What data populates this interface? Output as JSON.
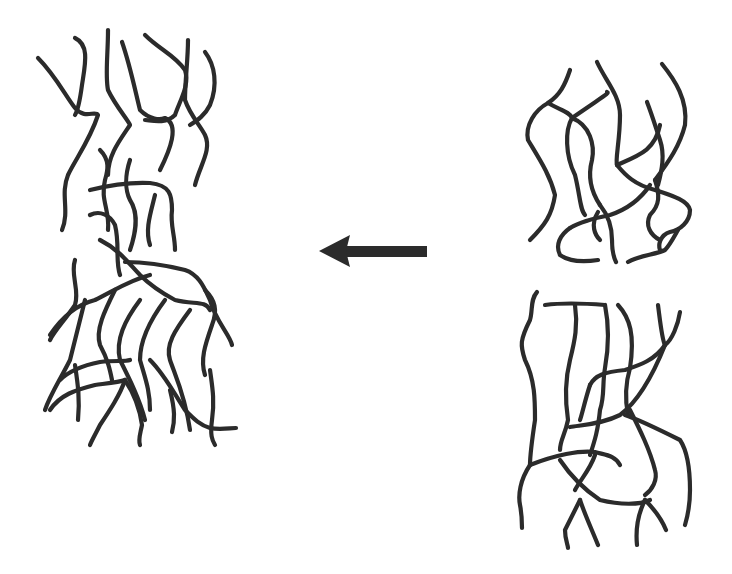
{
  "diagram": {
    "type": "schematic",
    "stroke_color": "#2b2b2b",
    "background": "#ffffff",
    "components": [
      {
        "id": "merged-network",
        "label": "",
        "position": "left",
        "bbox": [
          35,
          30,
          240,
          450
        ]
      },
      {
        "id": "direction-arrow",
        "label": "",
        "position": "center",
        "direction": "left",
        "bbox": [
          318,
          235,
          428,
          268
        ]
      },
      {
        "id": "upper-network",
        "label": "",
        "position": "right-top",
        "bbox": [
          520,
          60,
          690,
          262
        ]
      },
      {
        "id": "lower-network",
        "label": "",
        "position": "right-bottom",
        "bbox": [
          515,
          290,
          690,
          550
        ]
      }
    ]
  }
}
